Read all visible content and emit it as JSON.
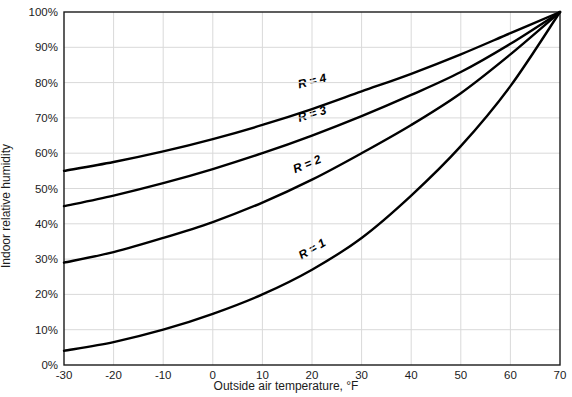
{
  "chart_data": {
    "type": "line",
    "title": "",
    "xlabel": "Outside air temperature, °F",
    "ylabel": "Indoor relative humidity",
    "xlim": [
      -30,
      70
    ],
    "ylim": [
      0,
      100
    ],
    "xticks": [
      -30,
      -20,
      -10,
      0,
      10,
      20,
      30,
      40,
      50,
      60,
      70
    ],
    "xtick_labels": [
      "-30",
      "-20",
      "-10",
      "0",
      "10",
      "20",
      "30",
      "40",
      "50",
      "60",
      "70"
    ],
    "yticks": [
      0,
      10,
      20,
      30,
      40,
      50,
      60,
      70,
      80,
      90,
      100
    ],
    "ytick_labels": [
      "0%",
      "10%",
      "20%",
      "30%",
      "40%",
      "50%",
      "60%",
      "70%",
      "80%",
      "90%",
      "100%"
    ],
    "grid": true,
    "grid_color": "#d9d9d9",
    "line_color": "#000000",
    "legend_position": "inline-labels",
    "x": [
      -30,
      -20,
      -10,
      0,
      10,
      20,
      30,
      40,
      50,
      60,
      70
    ],
    "series": [
      {
        "name": "R = 1",
        "label": "R = 1",
        "values": [
          4,
          6.5,
          10,
          14.5,
          20,
          27,
          36,
          48,
          62,
          79,
          100
        ],
        "label_x": 20,
        "label_y": 33,
        "label_rotation": -30
      },
      {
        "name": "R = 2",
        "label": "R = 2",
        "values": [
          29,
          32,
          36,
          40.5,
          46,
          52.5,
          60,
          68,
          77,
          88,
          100
        ],
        "label_x": 19,
        "label_y": 57,
        "label_rotation": -22
      },
      {
        "name": "R = 3",
        "label": "R = 3",
        "values": [
          45,
          48,
          51.5,
          55.5,
          60,
          65,
          70.5,
          76.5,
          83,
          91,
          100
        ],
        "label_x": 20,
        "label_y": 71,
        "label_rotation": -17
      },
      {
        "name": "R = 4",
        "label": "R = 4",
        "values": [
          55,
          57.5,
          60.5,
          64,
          68,
          72.5,
          77.5,
          82.5,
          88,
          94,
          100
        ],
        "label_x": 20,
        "label_y": 80.5,
        "label_rotation": -14
      }
    ]
  }
}
